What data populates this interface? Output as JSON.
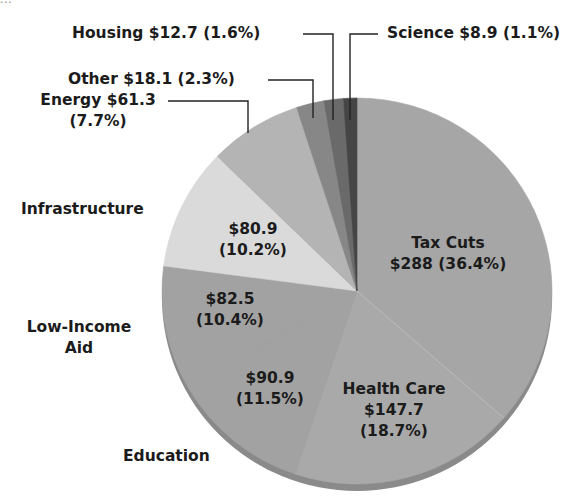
{
  "header": {
    "cutoff_text": "..."
  },
  "chart_data": {
    "type": "pie",
    "title": "",
    "units": "$ (billions)",
    "start_angle_deg": 0,
    "direction": "clockwise",
    "slices": [
      {
        "label": "Tax Cuts",
        "value": 288,
        "percent": 36.4,
        "color": "#a6a6a6",
        "value_text": "$288",
        "percent_text": "(36.4%)"
      },
      {
        "label": "Health Care",
        "value": 147.7,
        "percent": 18.7,
        "color": "#a9a9a9",
        "value_text": "$147.7",
        "percent_text": "(18.7%)"
      },
      {
        "label": "Education",
        "value": 90.9,
        "percent": 11.5,
        "color": "#a2a2a2",
        "value_text": "$90.9",
        "percent_text": "(11.5%)"
      },
      {
        "label": "Low-Income Aid",
        "value": 82.5,
        "percent": 10.4,
        "color": "#a2a2a2",
        "value_text": "$82.5",
        "percent_text": "(10.4%)"
      },
      {
        "label": "Infrastructure",
        "value": 80.9,
        "percent": 10.2,
        "color": "#dadada",
        "value_text": "$80.9",
        "percent_text": "(10.2%)"
      },
      {
        "label": "Energy",
        "value": 61.3,
        "percent": 7.7,
        "color": "#b4b4b4",
        "value_text": "$61.3",
        "percent_text": "(7.7%)"
      },
      {
        "label": "Other",
        "value": 18.1,
        "percent": 2.3,
        "color": "#878787",
        "value_text": "$18.1",
        "percent_text": "(2.3%)"
      },
      {
        "label": "Housing",
        "value": 12.7,
        "percent": 1.6,
        "color": "#6a6a6a",
        "value_text": "$12.7",
        "percent_text": "(1.6%)"
      },
      {
        "label": "Science",
        "value": 8.9,
        "percent": 1.1,
        "color": "#454545",
        "value_text": "$8.9",
        "percent_text": "(1.1%)"
      }
    ]
  },
  "labels": {
    "housing": "Housing $12.7 (1.6%)",
    "science": "Science $8.9 (1.1%)",
    "other": "Other $18.1 (2.3%)",
    "energy_l1": "Energy $61.3",
    "energy_l2": "(7.7%)",
    "infrastructure_name": "Infrastructure",
    "infrastructure_l1": "$80.9",
    "infrastructure_l2": "(10.2%)",
    "taxcuts_l1": "Tax Cuts",
    "taxcuts_l2": "$288 (36.4%)",
    "lowincome_name_l1": "Low-Income",
    "lowincome_name_l2": "Aid",
    "lowincome_l1": "$82.5",
    "lowincome_l2": "(10.4%)",
    "education_l1": "$90.9",
    "education_l2": "(11.5%)",
    "education_name": "Education",
    "healthcare_l1": "Health Care",
    "healthcare_l2": "$147.7",
    "healthcare_l3": "(18.7%)"
  }
}
